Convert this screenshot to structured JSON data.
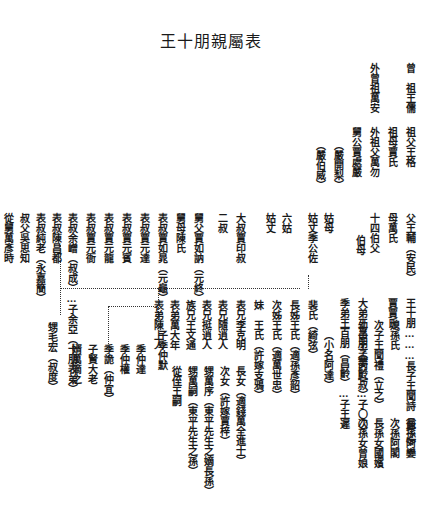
{
  "title": "王十朋親屬表",
  "columns": [
    {
      "id": "c1",
      "text": "曾　祖王儒",
      "x": 400,
      "y": 63
    },
    {
      "id": "c2",
      "text": "外曾祖萬安",
      "x": 364,
      "y": 63
    },
    {
      "id": "c3",
      "text": "祖父王格",
      "x": 400,
      "y": 127
    },
    {
      "id": "c4",
      "text": "祖母賈氏",
      "x": 382,
      "y": 127
    },
    {
      "id": "c5",
      "text": "外祖父萬勿",
      "x": 364,
      "y": 127
    },
    {
      "id": "c6",
      "text": "舅公賈處嚴",
      "x": 346,
      "y": 127
    },
    {
      "id": "c7",
      "text": "（嚴開梨）",
      "x": 328,
      "y": 140
    },
    {
      "id": "c8",
      "text": "（嚴伯威）",
      "x": 310,
      "y": 140
    },
    {
      "id": "c9",
      "text": "父王輔（安民）",
      "x": 400,
      "y": 213
    },
    {
      "id": "c10",
      "text": "母萬氏",
      "x": 382,
      "y": 213
    },
    {
      "id": "c11",
      "text": "十四伯父",
      "x": 364,
      "y": 213
    },
    {
      "id": "c12",
      "text": "伯母",
      "x": 350,
      "y": 235
    },
    {
      "id": "c13",
      "text": "姑母",
      "x": 318,
      "y": 213
    },
    {
      "id": "c14",
      "text": "姑丈季公佐",
      "x": 302,
      "y": 213
    },
    {
      "id": "c15",
      "text": "六姑",
      "x": 276,
      "y": 213
    },
    {
      "id": "c16",
      "text": "姑丈",
      "x": 260,
      "y": 213
    },
    {
      "id": "c17",
      "text": "大叔賈印叔",
      "x": 230,
      "y": 213
    },
    {
      "id": "c18",
      "text": "二叔",
      "x": 212,
      "y": 213
    },
    {
      "id": "c19",
      "text": "舅父賈如訥（元終）",
      "x": 188,
      "y": 213
    },
    {
      "id": "c20",
      "text": "舅母陳氏",
      "x": 170,
      "y": 213
    },
    {
      "id": "c21",
      "text": "表叔賈如晁（元龜）",
      "x": 152,
      "y": 213
    },
    {
      "id": "c22",
      "text": "表叔賈元達",
      "x": 134,
      "y": 213
    },
    {
      "id": "c23",
      "text": "表叔賈元賓",
      "x": 116,
      "y": 213
    },
    {
      "id": "c24",
      "text": "表叔賈元龍",
      "x": 98,
      "y": 213
    },
    {
      "id": "c25",
      "text": "表叔賈元衙",
      "x": 80,
      "y": 213
    },
    {
      "id": "c26",
      "text": "表叔余嶒（叔成）…子余亞（十朋表弟）",
      "x": 62,
      "y": 213
    },
    {
      "id": "c27",
      "text": "表叔陳昌都",
      "x": 46,
      "y": 213
    },
    {
      "id": "c28",
      "text": "表叔純老（永嘉簡）",
      "x": 30,
      "y": 213
    },
    {
      "id": "c29",
      "text": "叔父吳思知",
      "x": 14,
      "y": 213
    },
    {
      "id": "c30",
      "text": "從舅萬彥時",
      "x": -2,
      "y": 213
    },
    {
      "id": "c31",
      "text": "王十朋………長子王聞詩（興之）",
      "x": 400,
      "y": 298
    },
    {
      "id": "c32",
      "text": "媳孫氏",
      "x": 384,
      "y": 320
    },
    {
      "id": "c33",
      "text": "次子王聞禮（立之）",
      "x": 368,
      "y": 320
    },
    {
      "id": "c34",
      "text": "幼子王孟丙（叔）",
      "x": 352,
      "y": 320
    },
    {
      "id": "c35",
      "text": "賈賈氏",
      "x": 382,
      "y": 298
    },
    {
      "id": "c36",
      "text": "大弟王昌朋（夢齡）…子〇〇",
      "x": 352,
      "y": 298
    },
    {
      "id": "c37",
      "text": "季弟王百朋（昌齡）…子王遲",
      "x": 334,
      "y": 298
    },
    {
      "id": "c38",
      "text": "（小名阿達）",
      "x": 318,
      "y": 330
    },
    {
      "id": "c39",
      "text": "裴氏（綺弦）",
      "x": 302,
      "y": 300
    },
    {
      "id": "c40",
      "text": "長姊王氏（適孫彥韶）",
      "x": 284,
      "y": 300
    },
    {
      "id": "c41",
      "text": "次姊王氏（適萬世忠）",
      "x": 266,
      "y": 300
    },
    {
      "id": "c42",
      "text": "妹　王氏（許嫁支鴉）",
      "x": 248,
      "y": 300
    },
    {
      "id": "c43",
      "text": "表兄李克明",
      "x": 230,
      "y": 300
    },
    {
      "id": "c44",
      "text": "表兄隨逍人",
      "x": 212,
      "y": 300
    },
    {
      "id": "c45",
      "text": "表兄挺逍人",
      "x": 196,
      "y": 300
    },
    {
      "id": "c46",
      "text": "族兄王文通",
      "x": 180,
      "y": 300
    },
    {
      "id": "c47",
      "text": "表弟萬大年",
      "x": 164,
      "y": 300
    },
    {
      "id": "c48",
      "text": "表弟陳上人",
      "x": 148,
      "y": 300
    },
    {
      "id": "c49",
      "text": "長女（適錢萬全進士）",
      "x": 230,
      "y": 366
    },
    {
      "id": "c50",
      "text": "次女（許嫁賈梓）",
      "x": 214,
      "y": 366
    },
    {
      "id": "c51",
      "text": "甥萬序（東平先生之嫡長孫）",
      "x": 198,
      "y": 366
    },
    {
      "id": "c52",
      "text": "甥萬嗣（東平先生之孫）",
      "x": 182,
      "y": 366
    },
    {
      "id": "c53",
      "text": "從侄王嗣",
      "x": 166,
      "y": 366
    },
    {
      "id": "c54",
      "text": "子季仲默",
      "x": 152,
      "y": 330
    },
    {
      "id": "c55",
      "text": "季仲達",
      "x": 130,
      "y": 344
    },
    {
      "id": "c56",
      "text": "季仲權",
      "x": 114,
      "y": 344
    },
    {
      "id": "c57",
      "text": "季詭（仲宜）",
      "x": 98,
      "y": 344
    },
    {
      "id": "c58",
      "text": "子賢大老",
      "x": 82,
      "y": 344
    },
    {
      "id": "c59",
      "text": "婿萬滴之",
      "x": 66,
      "y": 344
    },
    {
      "id": "c60",
      "text": "甥毛宏（叔度）",
      "x": 42,
      "y": 322
    },
    {
      "id": "c61",
      "text": "長孫阿孌",
      "x": 400,
      "y": 418
    },
    {
      "id": "c62",
      "text": "次孫阿閣",
      "x": 384,
      "y": 418
    },
    {
      "id": "c63",
      "text": "長孫女國嬪",
      "x": 368,
      "y": 418
    },
    {
      "id": "c64",
      "text": "次孫女曾娘",
      "x": 352,
      "y": 418
    }
  ],
  "connectors": {
    "horizontal": [
      {
        "x": 60,
        "y": 288,
        "w": 240
      },
      {
        "x": 108,
        "y": 306,
        "w": 46
      }
    ],
    "vertical": [
      {
        "x": 308,
        "y": 275,
        "h": 14
      },
      {
        "x": 158,
        "y": 288,
        "h": 40
      },
      {
        "x": 108,
        "y": 306,
        "h": 50
      },
      {
        "x": 60,
        "y": 245,
        "h": 70
      }
    ]
  }
}
